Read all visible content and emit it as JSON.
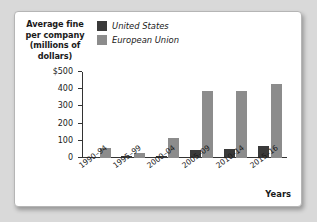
{
  "chart_data": {
    "type": "bar",
    "title": "",
    "ylabel": "Average fine per company (millions of dollars)",
    "xlabel": "Years",
    "categories": [
      "1990–94",
      "1995–99",
      "2000–04",
      "2005–09",
      "2010–14",
      "2015–16"
    ],
    "series": [
      {
        "name": "United States",
        "color": "#3a3a3a",
        "values": [
          3,
          9,
          12,
          48,
          52,
          70
        ]
      },
      {
        "name": "European Union",
        "color": "#8c8c8c",
        "values": [
          58,
          30,
          115,
          388,
          392,
          432
        ]
      }
    ],
    "ylim": [
      0,
      500
    ],
    "ytick_labels": [
      "$500",
      "400",
      "300",
      "200",
      "100",
      "0"
    ],
    "ytick_values": [
      500,
      400,
      300,
      200,
      100,
      0
    ],
    "grid": false,
    "legend_position": "top-left"
  },
  "axes": {
    "y_title": "Average fine per company (millions of dollars)",
    "y_title_lines": [
      "Average fine",
      "per company",
      "(millions of",
      "dollars)"
    ],
    "x_title": "Years"
  },
  "legend": {
    "items": [
      {
        "label": "United States",
        "color": "#3a3a3a"
      },
      {
        "label": "European Union",
        "color": "#8c8c8c"
      }
    ]
  },
  "colors": {
    "page_background": "#d9d9d9",
    "card_background": "#ffffff",
    "card_border": "#b5b5b5",
    "axis": "#333333",
    "text": "#1a1a1a",
    "us_bar": "#3a3a3a",
    "eu_bar": "#8c8c8c"
  }
}
